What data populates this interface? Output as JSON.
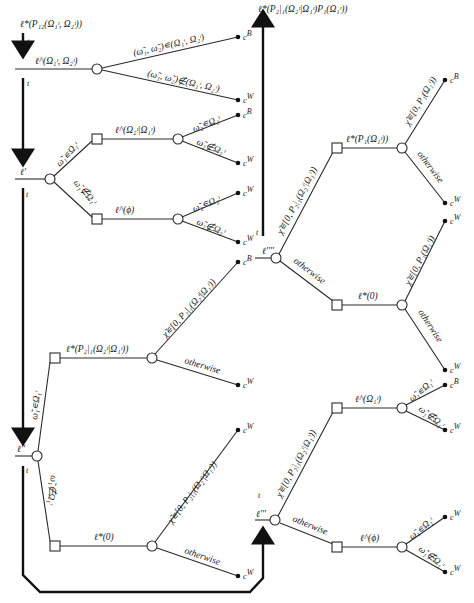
{
  "diagram": {
    "top_left_cost_label": "ℓ*(P₁₂(Ω₁ᶦ, Ω₂ᶦ))",
    "top_left_time_label": "t",
    "root_cost_label": "ℓ^(Ω₁ᶦ, Ω₂ᶦ)",
    "root_branches": [
      {
        "label": "(ω̃₁, ω̃₂)∊(Ω₁ᶦ, Ω₂ᶦ)",
        "outcome": "c",
        "outcome_sup": "B"
      },
      {
        "label": "(ω̃₁, ω̃₂)∉(Ω₁ᶦ, Ω₂ᶦ)",
        "outcome": "c",
        "outcome_sup": "W"
      }
    ],
    "left_mid_time_label": "t",
    "seq_node_label": "ℓ'",
    "seq_node_time": "t",
    "seq_branch_in": "ω̃₁∊Ω₁ᶦ",
    "seq_branch_out": "ω̃₁∉Ω₁ᶦ",
    "seq_upper_cost": "ℓ^(Ω₂ᶦ|Ω₁ᶦ)",
    "seq_upper_branches": [
      {
        "label": "ω̃₂∊Ω₂ᶦ",
        "outcome": "c",
        "outcome_sup": "B"
      },
      {
        "label": "ω̃₂∉Ω₂ᶦ",
        "outcome": "c",
        "outcome_sup": "W"
      }
    ],
    "seq_lower_cost": "ℓ^(ϕ)",
    "seq_lower_branches": [
      {
        "label": "ω̃₂∊Ω₂ᶦ",
        "outcome": "c",
        "outcome_sup": "W"
      },
      {
        "label": "ω̃₂∉Ω₂ᶦ",
        "outcome": "c",
        "outcome_sup": "W"
      }
    ],
    "ex_node_label": "ℓ''",
    "ex_node_time": "t",
    "ex_branch_in": "ω̃₁∊Ω₁ᶦ",
    "ex_branch_out": "ω̃₁∉Ω₁ᶦ",
    "ex_upper_cost": "ℓ*(P₂|₁(Ω₂ᶦ|Ω₁ᶦ))",
    "ex_upper_branches": [
      {
        "label": "χ̃∊[0, P₂|₁(Ω₂ᶦ|Ω₁ᶦ))",
        "outcome": "c",
        "outcome_sup": "B"
      },
      {
        "label": "otherwise",
        "outcome": "c",
        "outcome_sup": "W"
      }
    ],
    "ex_lower_cost": "ℓ*(0)",
    "ex_lower_branches": [
      {
        "label": "χ̃∊[0, P₂|₁(Ω₂ᶦ|Ω₁ᶦ))",
        "outcome": "c",
        "outcome_sup": "W"
      },
      {
        "label": "otherwise",
        "outcome": "c",
        "outcome_sup": "W"
      }
    ],
    "top_right_cost_label": "ℓ*(P₂|₁(Ω₂ᶦ|Ω₁ᶦ)P₁(Ω₁ᶦ))",
    "right_up_time_label": "t",
    "r4_node_label": "ℓ''''",
    "r4_branch_in": "χ̃∊[0, P₂|₁(Ω₂ᶦ|Ω₁ᶦ))",
    "r4_branch_out": "otherwise",
    "r4_upper_cost": "ℓ*(P₁(Ω₁ᶦ))",
    "r4_upper_branches": [
      {
        "label": "χ̃∊[0, P₁(Ω₁ᶦ))",
        "outcome": "c",
        "outcome_sup": "B"
      },
      {
        "label": "otherwise",
        "outcome": "c",
        "outcome_sup": "W"
      }
    ],
    "r4_lower_cost": "ℓ*(0)",
    "r4_lower_branches": [
      {
        "label": "χ̃∊[0, P₁(Ω₁ᶦ))",
        "outcome": "c",
        "outcome_sup": "W"
      },
      {
        "label": "otherwise",
        "outcome": "c",
        "outcome_sup": "W"
      }
    ],
    "r3_node_label": "ℓ'''",
    "r3_node_time": "t",
    "r3_branch_in": "χ̃∊[0, P₂|₁(Ω₂ᶦ|Ω₁ᶦ))",
    "r3_branch_out": "otherwise",
    "r3_upper_cost": "ℓ^(Ω₁ᶦ)",
    "r3_upper_branches": [
      {
        "label": "ω̃₁∊Ω₁ᶦ",
        "outcome": "c",
        "outcome_sup": "B"
      },
      {
        "label": "ω̃₁∉Ω₁ᶦ",
        "outcome": "c",
        "outcome_sup": "W"
      }
    ],
    "r3_lower_cost": "ℓ^(ϕ)",
    "r3_lower_branches": [
      {
        "label": "ω̃₁∊Ω₁ᶦ",
        "outcome": "c",
        "outcome_sup": "W"
      },
      {
        "label": "ω̃₁∉Ω₁ᶦ",
        "outcome": "c",
        "outcome_sup": "W"
      }
    ]
  }
}
